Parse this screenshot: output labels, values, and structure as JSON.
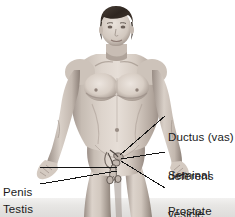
{
  "figure": {
    "background_color": "#ffffff",
    "bottom_band_color": "#e8e8e8",
    "label_text_color": "#1a1a1a",
    "leader_line_color": "#1a1a1a",
    "skin_tone": "#d8cec6",
    "skin_shadow": "#9b8f86",
    "hair_color": "#3a3128"
  },
  "labels": [
    {
      "id": "ductus-vas-deferens",
      "line1": "Ductus (vas)",
      "line2": "deferens",
      "side": "right",
      "x": 168,
      "y": 110
    },
    {
      "id": "seminal-vesicle",
      "line1": "Seminal",
      "line2": "vesicle",
      "side": "right",
      "x": 168,
      "y": 148
    },
    {
      "id": "prostate-gland",
      "line1": "Prostate",
      "line2": "gland",
      "side": "right",
      "x": 168,
      "y": 184
    },
    {
      "id": "penis",
      "line1": "Penis",
      "line2": "",
      "side": "left",
      "x": 3,
      "y": 161
    },
    {
      "id": "testis",
      "line1": "Testis",
      "line2": "",
      "side": "left",
      "x": 3,
      "y": 178
    }
  ],
  "leader_lines": [
    {
      "id": "leader-ductus",
      "x1": 165,
      "y1": 116,
      "x2": 120,
      "y2": 155
    },
    {
      "id": "leader-seminal",
      "x1": 165,
      "y1": 152,
      "x2": 121,
      "y2": 159
    },
    {
      "id": "leader-prostate",
      "x1": 165,
      "y1": 188,
      "x2": 121,
      "y2": 161
    },
    {
      "id": "leader-penis",
      "x1": 40,
      "y1": 167,
      "x2": 117,
      "y2": 167
    },
    {
      "id": "leader-testis",
      "x1": 40,
      "y1": 184,
      "x2": 117,
      "y2": 171
    }
  ]
}
